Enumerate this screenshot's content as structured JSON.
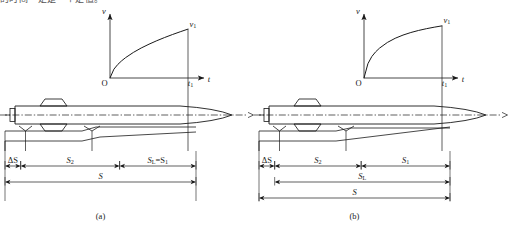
{
  "page": {
    "clipped_top_text": "的时间一定是一个定值。",
    "width": 509,
    "height": 228,
    "background": "#ffffff",
    "line_color": "#1a1a1a"
  },
  "panels": [
    {
      "id": "a",
      "caption": "(a)",
      "graph": {
        "type": "line",
        "title": "",
        "xlabel": "t",
        "ylabel": "v",
        "origin_label": "O",
        "x_tick_label": "t₁",
        "y_value_label": "v₁",
        "xlim": [
          0,
          1.18
        ],
        "ylim": [
          0,
          1.15
        ],
        "grid": false,
        "curve_shape": "concave-increasing",
        "curve_exponent": 0.62,
        "x": [
          0,
          0.05,
          0.1,
          0.15,
          0.2,
          0.3,
          0.4,
          0.5,
          0.6,
          0.7,
          0.8,
          0.9,
          1.0
        ],
        "y": [
          0,
          0.152,
          0.234,
          0.297,
          0.351,
          0.441,
          0.517,
          0.583,
          0.643,
          0.698,
          0.749,
          0.797,
          0.843
        ]
      },
      "dimensions": {
        "rows": [
          {
            "label": "ΔS",
            "from": 0.0,
            "to": 0.082,
            "row": 0
          },
          {
            "label": "S₂",
            "from": 0.082,
            "to": 0.6,
            "row": 0
          },
          {
            "label": "Sᴸ=S₁",
            "from": 0.6,
            "to": 1.0,
            "row": 0
          },
          {
            "label": "S",
            "from": 0.0,
            "to": 1.0,
            "row": 1
          }
        ]
      }
    },
    {
      "id": "b",
      "caption": "(b)",
      "graph": {
        "type": "line",
        "title": "",
        "xlabel": "t",
        "ylabel": "v",
        "origin_label": "O",
        "x_tick_label": "t₁",
        "y_value_label": "v₁",
        "xlim": [
          0,
          1.18
        ],
        "ylim": [
          0,
          1.15
        ],
        "grid": false,
        "curve_shape": "saturating-exponential",
        "curve_exponent": 0.42,
        "x": [
          0,
          0.05,
          0.1,
          0.15,
          0.2,
          0.3,
          0.4,
          0.5,
          0.6,
          0.7,
          0.8,
          0.9,
          1.0
        ],
        "y": [
          0,
          0.246,
          0.37,
          0.452,
          0.516,
          0.613,
          0.685,
          0.74,
          0.784,
          0.82,
          0.85,
          0.876,
          0.899
        ]
      },
      "dimensions": {
        "rows": [
          {
            "label": "ΔS",
            "from": 0.0,
            "to": 0.082,
            "row": 0
          },
          {
            "label": "S₂",
            "from": 0.082,
            "to": 0.535,
            "row": 0
          },
          {
            "label": "S₁",
            "from": 0.535,
            "to": 1.0,
            "row": 0
          },
          {
            "label": "Sᴸ",
            "from": 0.082,
            "to": 1.0,
            "row": 1
          },
          {
            "label": "S",
            "from": 0.0,
            "to": 1.0,
            "row": 2
          }
        ]
      }
    }
  ],
  "vehicle": {
    "name": "projectile-profile",
    "features": [
      "breech-block",
      "upper-band-trapezoid",
      "lower-band-trapezoid",
      "centerline-dash-dot",
      "ogive-nose",
      "reference-marker-v-1",
      "reference-marker-v-2"
    ]
  }
}
